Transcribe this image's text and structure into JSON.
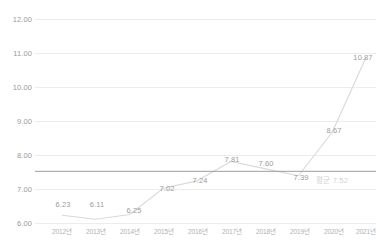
{
  "chart_data": {
    "type": "line",
    "title": "",
    "subtitle": "",
    "xlabel": "",
    "ylabel": "",
    "categories": [
      "2012년",
      "2013년",
      "2014년",
      "2015년",
      "2016년",
      "2017년",
      "2018년",
      "2019년",
      "2020년",
      "2021년"
    ],
    "values": [
      6.23,
      6.11,
      6.25,
      7.02,
      7.24,
      7.81,
      7.6,
      7.39,
      8.67,
      10.87
    ],
    "point_labels": [
      "6.23",
      "6.11",
      "6.25",
      "7.02",
      "7.24",
      "7.81",
      "7.60",
      "7.39",
      "8.67",
      "10.87"
    ],
    "ylim": [
      6.0,
      12.0
    ],
    "yticks": [
      6.0,
      7.0,
      8.0,
      9.0,
      10.0,
      11.0,
      12.0
    ],
    "ytick_labels": [
      "6.00",
      "7.00",
      "8.00",
      "9.00",
      "10.00",
      "11.00",
      "12.00"
    ],
    "grid": true,
    "legend": "none",
    "series_color": "#d9d9d9",
    "grid_color": "#ececec",
    "reference_line": {
      "value": 7.52,
      "label": "평균 7.52",
      "color": "#9e9e9e"
    }
  }
}
